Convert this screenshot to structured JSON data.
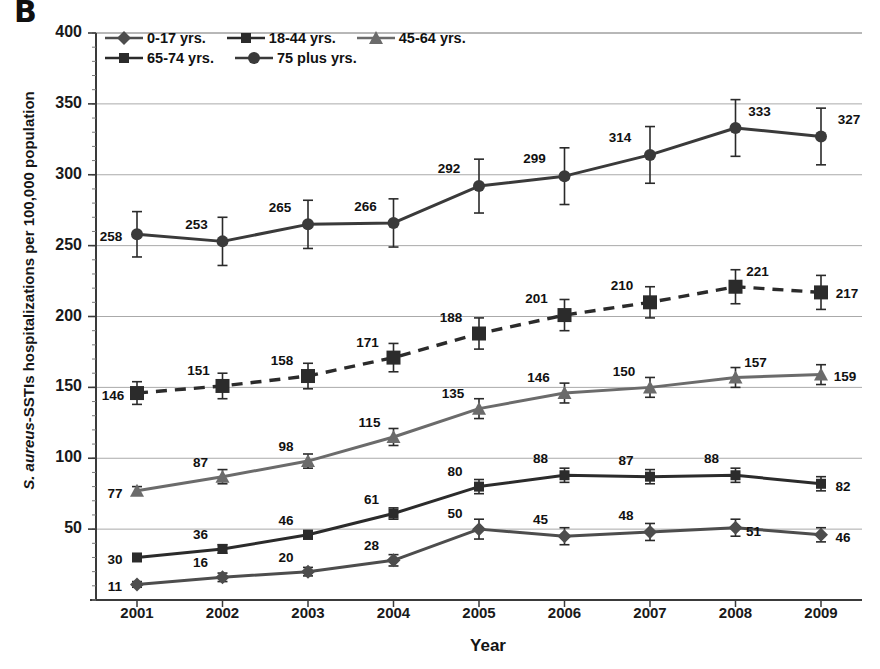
{
  "panel": {
    "letter": "B"
  },
  "chart_data": {
    "type": "line",
    "title": "",
    "xlabel": "Year",
    "ylabel": "S. aureus-SSTIs hospitalizations per 100,000 population",
    "ylabel_italic_part": "S. aureus",
    "ylabel_rest": "-SSTIs hospitalizations per 100,000 population",
    "categories": [
      "2001",
      "2002",
      "2003",
      "2004",
      "2005",
      "2006",
      "2007",
      "2008",
      "2009"
    ],
    "x": [
      2001,
      2002,
      2003,
      2004,
      2005,
      2006,
      2007,
      2008,
      2009
    ],
    "ylim": [
      0,
      400
    ],
    "yticks": [
      400,
      350,
      300,
      250,
      200,
      150,
      100,
      50
    ],
    "ytick_labels": [
      "400",
      "350",
      "300",
      "250",
      "200",
      "150",
      "100",
      "50"
    ],
    "grid": true,
    "legend_position": "top-left-inside",
    "series": [
      {
        "name": "0-17 yrs.",
        "marker": "diamond",
        "linestyle": "solid",
        "color": "#4d4d4d",
        "values": [
          11,
          16,
          20,
          28,
          50,
          45,
          48,
          51,
          46
        ],
        "errors": [
          2,
          3,
          3,
          4,
          7,
          6,
          6,
          6,
          5
        ],
        "labels": [
          "11",
          "16",
          "20",
          "28",
          "50",
          "45",
          "48",
          "51",
          "46"
        ]
      },
      {
        "name": "18-44 yrs.",
        "marker": "square",
        "linestyle": "solid",
        "color": "#2b2b2b",
        "values": [
          30,
          36,
          46,
          61,
          80,
          88,
          87,
          88,
          82
        ],
        "errors": [
          2,
          3,
          3,
          4,
          5,
          5,
          5,
          5,
          5
        ],
        "labels": [
          "30",
          "36",
          "46",
          "61",
          "80",
          "88",
          "87",
          "88",
          "82"
        ]
      },
      {
        "name": "45-64 yrs.",
        "marker": "triangle",
        "linestyle": "solid",
        "color": "#6b6b6b",
        "values": [
          77,
          87,
          98,
          115,
          135,
          146,
          150,
          157,
          159
        ],
        "errors": [
          3,
          5,
          5,
          6,
          7,
          7,
          7,
          7,
          7
        ],
        "labels": [
          "77",
          "87",
          "98",
          "115",
          "135",
          "146",
          "150",
          "157",
          "159"
        ]
      },
      {
        "name": "65-74 yrs.",
        "marker": "bigsquare",
        "linestyle": "dashed",
        "color": "#2b2b2b",
        "values": [
          146,
          151,
          158,
          171,
          188,
          201,
          210,
          221,
          217
        ],
        "errors": [
          8,
          9,
          9,
          10,
          11,
          11,
          11,
          12,
          12
        ],
        "labels": [
          "146",
          "151",
          "158",
          "171",
          "188",
          "201",
          "210",
          "221",
          "217"
        ]
      },
      {
        "name": "75 plus yrs.",
        "marker": "circle",
        "linestyle": "solid",
        "color": "#3a3a3a",
        "values": [
          258,
          253,
          265,
          266,
          292,
          299,
          314,
          333,
          327
        ],
        "errors": [
          16,
          17,
          17,
          17,
          19,
          20,
          20,
          20,
          20
        ],
        "labels": [
          "258",
          "253",
          "265",
          "266",
          "292",
          "299",
          "314",
          "333",
          "327"
        ]
      }
    ]
  }
}
